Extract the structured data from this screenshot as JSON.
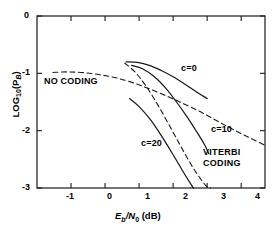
{
  "chart_data": {
    "type": "line",
    "title": "",
    "xlabel": "Eb/N0 (dB)",
    "ylabel": "LOG10(PB)",
    "xlim": [
      -2,
      4.7
    ],
    "ylim": [
      -3,
      0
    ],
    "xticks": [
      -1,
      0,
      1,
      2,
      3,
      4
    ],
    "yticks": [
      0,
      -1,
      -2,
      -3
    ],
    "xtick_labels": [
      "-1",
      "0",
      "1",
      "2",
      "3",
      "4"
    ],
    "ytick_labels": [
      "0",
      "-1",
      "-2",
      "-3"
    ],
    "grid": false,
    "legend": "inline-annotations",
    "annotations": [
      {
        "text": "NO CODING",
        "x": -1.55,
        "y": -1.12
      },
      {
        "text": "c=0",
        "x": 1.95,
        "y": -0.9
      },
      {
        "text": "c=10",
        "x": 2.75,
        "y": -1.95
      },
      {
        "text": "c=20",
        "x": 0.95,
        "y": -2.2
      },
      {
        "text": "VITERBI",
        "x": 2.55,
        "y": -2.35
      },
      {
        "text": "CODING",
        "x": 2.55,
        "y": -2.55
      }
    ],
    "series": [
      {
        "name": "NO CODING",
        "style": "dashed",
        "points": [
          [
            -1.53,
            -0.985
          ],
          [
            -1.1,
            -0.975
          ],
          [
            -0.6,
            -0.99
          ],
          [
            -0.1,
            -1.03
          ],
          [
            0.4,
            -1.09
          ],
          [
            0.9,
            -1.18
          ],
          [
            1.3,
            -1.27
          ],
          [
            1.75,
            -1.38
          ],
          [
            2.2,
            -1.5
          ],
          [
            2.7,
            -1.64
          ],
          [
            3.2,
            -1.8
          ],
          [
            3.7,
            -1.96
          ],
          [
            4.2,
            -2.11
          ],
          [
            4.68,
            -2.25
          ]
        ]
      },
      {
        "name": "c=0",
        "style": "solid",
        "points": [
          [
            0.62,
            -0.8
          ],
          [
            0.95,
            -0.81
          ],
          [
            1.3,
            -0.86
          ],
          [
            1.65,
            -0.95
          ],
          [
            2.0,
            -1.06
          ],
          [
            2.35,
            -1.19
          ],
          [
            2.7,
            -1.33
          ],
          [
            3.0,
            -1.44
          ]
        ]
      },
      {
        "name": "c=10",
        "style": "solid",
        "points": [
          [
            0.78,
            -0.86
          ],
          [
            1.1,
            -0.92
          ],
          [
            1.45,
            -1.06
          ],
          [
            1.8,
            -1.27
          ],
          [
            2.1,
            -1.5
          ],
          [
            2.4,
            -1.75
          ],
          [
            2.65,
            -1.98
          ],
          [
            2.9,
            -2.22
          ],
          [
            3.05,
            -2.4
          ]
        ]
      },
      {
        "name": "c=20",
        "style": "solid",
        "points": [
          [
            0.72,
            -1.44
          ],
          [
            1.0,
            -1.58
          ],
          [
            1.35,
            -1.82
          ],
          [
            1.7,
            -2.13
          ],
          [
            2.0,
            -2.42
          ],
          [
            2.3,
            -2.72
          ],
          [
            2.55,
            -2.96
          ],
          [
            2.6,
            -3.0
          ]
        ]
      },
      {
        "name": "unlabeled-steep-dashed",
        "style": "dashed",
        "points": [
          [
            0.58,
            -0.82
          ],
          [
            0.9,
            -0.99
          ],
          [
            1.2,
            -1.22
          ],
          [
            1.55,
            -1.55
          ],
          [
            1.9,
            -1.92
          ],
          [
            2.25,
            -2.3
          ],
          [
            2.6,
            -2.66
          ],
          [
            2.95,
            -2.95
          ],
          [
            3.1,
            -3.0
          ]
        ]
      }
    ]
  },
  "axis": {
    "x_label_main": "E",
    "x_label_sub1": "b",
    "x_label_slash": "/N",
    "x_label_sub2": "0",
    "x_label_unit": " (dB)",
    "y_label_main": "LOG",
    "y_label_sub1": "10",
    "y_label_open": "(P",
    "y_label_sub2": "B",
    "y_label_close": ")"
  }
}
